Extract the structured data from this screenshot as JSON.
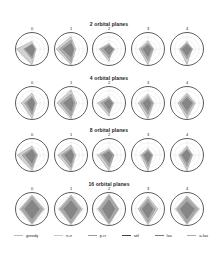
{
  "chart_data": {
    "type": "radar",
    "axes_per_chart": 4,
    "rows": [
      {
        "title": "2 orbital planes",
        "panels": [
          {
            "label": "0",
            "series": [
              [
                0.45,
                0.25,
                0.95,
                0.95
              ],
              [
                0.3,
                0.2,
                0.6,
                0.5
              ],
              [
                0.25,
                0.15,
                0.45,
                0.4
              ]
            ]
          },
          {
            "label": "1",
            "series": [
              [
                0.75,
                0.3,
                0.95,
                0.9
              ],
              [
                0.55,
                0.2,
                0.8,
                0.7
              ],
              [
                0.35,
                0.15,
                0.5,
                0.5
              ]
            ]
          },
          {
            "label": "2",
            "series": [
              [
                0.35,
                0.2,
                0.75,
                0.6
              ],
              [
                0.25,
                0.35,
                0.55,
                0.5
              ],
              [
                0.2,
                0.25,
                0.35,
                0.3
              ]
            ]
          },
          {
            "label": "3",
            "series": [
              [
                0.5,
                0.35,
                0.95,
                0.55
              ],
              [
                0.35,
                0.3,
                0.7,
                0.45
              ],
              [
                0.25,
                0.2,
                0.45,
                0.3
              ]
            ]
          },
          {
            "label": "4",
            "series": [
              [
                0.45,
                0.3,
                0.95,
                0.45
              ],
              [
                0.35,
                0.35,
                0.6,
                0.4
              ],
              [
                0.25,
                0.25,
                0.4,
                0.3
              ]
            ]
          }
        ]
      },
      {
        "title": "4 orbital planes",
        "panels": [
          {
            "label": "0",
            "series": [
              [
                0.6,
                0.3,
                0.95,
                0.65
              ],
              [
                0.4,
                0.2,
                0.7,
                0.45
              ],
              [
                0.3,
                0.15,
                0.5,
                0.3
              ]
            ]
          },
          {
            "label": "1",
            "series": [
              [
                0.8,
                0.35,
                0.95,
                0.85
              ],
              [
                0.55,
                0.25,
                0.8,
                0.65
              ],
              [
                0.35,
                0.15,
                0.5,
                0.45
              ]
            ]
          },
          {
            "label": "2",
            "series": [
              [
                0.4,
                0.2,
                0.8,
                0.7
              ],
              [
                0.3,
                0.3,
                0.6,
                0.5
              ],
              [
                0.2,
                0.2,
                0.4,
                0.3
              ]
            ]
          },
          {
            "label": "3",
            "series": [
              [
                0.55,
                0.35,
                0.95,
                0.6
              ],
              [
                0.4,
                0.3,
                0.7,
                0.45
              ],
              [
                0.25,
                0.2,
                0.45,
                0.3
              ]
            ]
          },
          {
            "label": "4",
            "series": [
              [
                0.6,
                0.5,
                0.95,
                0.55
              ],
              [
                0.45,
                0.4,
                0.7,
                0.45
              ],
              [
                0.3,
                0.3,
                0.45,
                0.3
              ]
            ]
          }
        ]
      },
      {
        "title": "8 orbital planes",
        "panels": [
          {
            "label": "0",
            "series": [
              [
                0.55,
                0.35,
                0.95,
                0.9
              ],
              [
                0.4,
                0.3,
                0.75,
                0.6
              ],
              [
                0.3,
                0.2,
                0.5,
                0.4
              ]
            ]
          },
          {
            "label": "1",
            "series": [
              [
                0.6,
                0.3,
                0.95,
                0.8
              ],
              [
                0.4,
                0.2,
                0.75,
                0.6
              ],
              [
                0.3,
                0.15,
                0.5,
                0.4
              ]
            ]
          },
          {
            "label": "2",
            "series": [
              [
                0.4,
                0.3,
                0.95,
                0.7
              ],
              [
                0.3,
                0.3,
                0.7,
                0.5
              ],
              [
                0.2,
                0.2,
                0.45,
                0.35
              ]
            ]
          },
          {
            "label": "3",
            "series": [
              [
                0.4,
                0.3,
                0.95,
                0.45
              ],
              [
                0.3,
                0.25,
                0.7,
                0.35
              ],
              [
                0.2,
                0.2,
                0.45,
                0.25
              ]
            ]
          },
          {
            "label": "4",
            "series": [
              [
                0.55,
                0.35,
                0.95,
                0.5
              ],
              [
                0.4,
                0.3,
                0.7,
                0.4
              ],
              [
                0.3,
                0.2,
                0.45,
                0.3
              ]
            ]
          }
        ]
      },
      {
        "title": "16 orbital planes",
        "panels": [
          {
            "label": "0",
            "series": [
              [
                0.85,
                0.75,
                0.95,
                0.75
              ],
              [
                0.75,
                0.65,
                0.85,
                0.65
              ],
              [
                0.55,
                0.45,
                0.6,
                0.45
              ]
            ]
          },
          {
            "label": "1",
            "series": [
              [
                0.85,
                0.7,
                0.95,
                0.75
              ],
              [
                0.75,
                0.6,
                0.85,
                0.65
              ],
              [
                0.5,
                0.4,
                0.6,
                0.45
              ]
            ]
          },
          {
            "label": "2",
            "series": [
              [
                0.9,
                0.6,
                0.95,
                0.7
              ],
              [
                0.8,
                0.55,
                0.85,
                0.6
              ],
              [
                0.55,
                0.35,
                0.6,
                0.4
              ]
            ]
          },
          {
            "label": "3",
            "series": [
              [
                0.75,
                0.6,
                0.95,
                0.6
              ],
              [
                0.6,
                0.45,
                0.8,
                0.5
              ],
              [
                0.4,
                0.3,
                0.55,
                0.35
              ]
            ]
          },
          {
            "label": "4",
            "series": [
              [
                0.8,
                0.75,
                0.95,
                0.7
              ],
              [
                0.7,
                0.65,
                0.85,
                0.6
              ],
              [
                0.45,
                0.45,
                0.6,
                0.4
              ]
            ]
          }
        ]
      }
    ],
    "legend": [
      "greedy",
      "n-rr",
      "p-rr",
      "util",
      "las",
      "a-las"
    ],
    "legend_position": "bottom",
    "grid": true
  },
  "rows_title": [
    "2 orbital planes",
    "4 orbital planes",
    "8 orbital planes",
    "16 orbital planes"
  ],
  "legend": {
    "items": [
      {
        "label": "greedy",
        "color": "#bbbbbb"
      },
      {
        "label": "n-rr",
        "color": "#c8c8c8"
      },
      {
        "label": "p-rr",
        "color": "#9a9a9a"
      },
      {
        "label": "util",
        "color": "#444444"
      },
      {
        "label": "las",
        "color": "#777777"
      },
      {
        "label": "a-las",
        "color": "#aaaaaa"
      }
    ]
  },
  "colors": {
    "fills": [
      "#c4c4c4",
      "#9c9c9c",
      "#7a7a7a"
    ],
    "circle": "#333333",
    "grid": "#dddddd"
  }
}
